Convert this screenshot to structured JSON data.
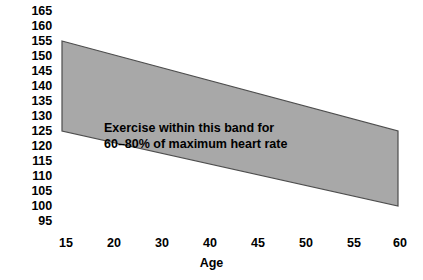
{
  "chart_data": {
    "type": "area",
    "title": "",
    "subtitle": "",
    "xlabel": "Age",
    "ylabel": "",
    "xlim": [
      15,
      60
    ],
    "ylim": [
      95,
      165
    ],
    "grid": false,
    "legend": null,
    "x_ticks": [
      15,
      20,
      30,
      40,
      45,
      50,
      55,
      60
    ],
    "x_tick_labels": [
      "15",
      "20",
      "30",
      "40",
      "45",
      "50",
      "55",
      "60"
    ],
    "y_ticks": [
      165,
      160,
      155,
      150,
      145,
      140,
      135,
      130,
      125,
      120,
      115,
      110,
      105,
      100,
      95
    ],
    "y_tick_labels": [
      "165",
      "160",
      "155",
      "150",
      "145",
      "140",
      "135",
      "130",
      "125",
      "120",
      "115",
      "110",
      "105",
      "100",
      "95"
    ],
    "band": {
      "name": "Target heart rate band",
      "x": [
        15,
        60
      ],
      "upper": [
        155,
        125
      ],
      "lower": [
        125,
        100
      ],
      "fill_color": "#a8a8a8",
      "edge_color": "#4d4d4d"
    },
    "annotations": [
      "Exercise within this band for",
      "60–80% of maximum heart rate"
    ]
  },
  "axes": {
    "x_title": "Age",
    "x_tick_labels": [
      "15",
      "20",
      "30",
      "40",
      "45",
      "50",
      "55",
      "60"
    ],
    "y_tick_labels": [
      "165",
      "160",
      "155",
      "150",
      "145",
      "140",
      "135",
      "130",
      "125",
      "120",
      "115",
      "110",
      "105",
      "100",
      "95"
    ]
  },
  "annotation": {
    "line1": "Exercise within this band for",
    "line2": "60–80% of maximum heart rate"
  },
  "colors": {
    "band_fill": "#a8a8a8",
    "band_edge": "#4d4d4d",
    "text": "#000000",
    "background": "#ffffff"
  }
}
